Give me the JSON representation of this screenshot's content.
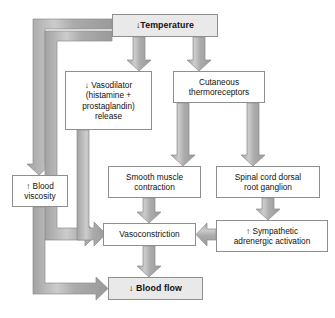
{
  "diagram": {
    "colors": {
      "arrow_fill": "#a6a6a6",
      "arrow_highlight": "#c9c9c9",
      "arrow_stroke": "#8e8e8e",
      "box_border": "#8e8e8e",
      "box_fill": "#ffffff",
      "box_fill_shaded": "#e9e9e9",
      "text": "#111111",
      "page_background": "#ffffff"
    },
    "glyphs": {
      "down_arrow": "↓",
      "up_arrow": "↑"
    },
    "nodes": [
      {
        "id": "temperature",
        "name": "temperature-node",
        "lines": [
          "↓Temperature"
        ],
        "emphasis": "bold",
        "fill": "shaded",
        "x": 112,
        "y": 14,
        "w": 106,
        "h": 23
      },
      {
        "id": "vasodilator",
        "name": "vasodilator-node",
        "lines": [
          "↓ Vasodilator",
          "(histamine +",
          "prostaglandin)",
          "release"
        ],
        "emphasis": "normal",
        "fill": "white",
        "x": 65,
        "y": 71,
        "w": 87,
        "h": 59
      },
      {
        "id": "thermoreceptors",
        "name": "cutaneous-thermoreceptors-node",
        "lines": [
          "Cutaneous",
          "thermoreceptors"
        ],
        "emphasis": "normal",
        "fill": "white",
        "x": 173,
        "y": 71,
        "w": 92,
        "h": 32
      },
      {
        "id": "blood-viscosity",
        "name": "blood-viscosity-node",
        "lines": [
          "↑ Blood",
          "viscosity"
        ],
        "emphasis": "normal",
        "fill": "white",
        "x": 12,
        "y": 175,
        "w": 56,
        "h": 32
      },
      {
        "id": "smooth-muscle",
        "name": "smooth-muscle-contraction-node",
        "lines": [
          "Smooth muscle",
          "contraction"
        ],
        "emphasis": "normal",
        "fill": "white",
        "x": 108,
        "y": 166,
        "w": 93,
        "h": 32
      },
      {
        "id": "spinal-cord",
        "name": "spinal-cord-dorsal-root-ganglion-node",
        "lines": [
          "Spinal cord dorsal",
          "root ganglion"
        ],
        "emphasis": "normal",
        "fill": "white",
        "x": 216,
        "y": 166,
        "w": 104,
        "h": 32
      },
      {
        "id": "sympathetic",
        "name": "sympathetic-adrenergic-activation-node",
        "lines": [
          "↑ Sympathetic",
          "adrenergic activation"
        ],
        "emphasis": "normal",
        "fill": "white",
        "x": 216,
        "y": 220,
        "w": 112,
        "h": 32
      },
      {
        "id": "vasoconstriction",
        "name": "vasoconstriction-node",
        "lines": [
          "Vasoconstriction"
        ],
        "emphasis": "normal",
        "fill": "white",
        "x": 103,
        "y": 223,
        "w": 93,
        "h": 23
      },
      {
        "id": "blood-flow",
        "name": "blood-flow-node",
        "lines": [
          "↓ Blood flow"
        ],
        "emphasis": "bold",
        "fill": "shaded",
        "x": 108,
        "y": 277,
        "w": 95,
        "h": 23
      }
    ],
    "edges": [
      {
        "id": "e1",
        "name": "edge-temperature-to-vasodilator",
        "from": "temperature",
        "to": "vasodilator",
        "shape": "straight-down"
      },
      {
        "id": "e2",
        "name": "edge-temperature-to-thermoreceptors",
        "from": "temperature",
        "to": "thermoreceptors",
        "shape": "straight-down"
      },
      {
        "id": "e3",
        "name": "edge-temperature-to-blood-viscosity",
        "from": "temperature",
        "to": "blood-viscosity",
        "shape": "left-then-down"
      },
      {
        "id": "e4",
        "name": "edge-temperature-to-vasoconstriction",
        "from": "temperature",
        "to": "vasoconstriction",
        "shape": "left-then-down-then-right"
      },
      {
        "id": "e5",
        "name": "edge-vasodilator-to-vasoconstriction",
        "from": "vasodilator",
        "to": "vasoconstriction",
        "shape": "down-then-right"
      },
      {
        "id": "e6",
        "name": "edge-thermoreceptors-to-smooth-muscle",
        "from": "thermoreceptors",
        "to": "smooth-muscle",
        "shape": "straight-down"
      },
      {
        "id": "e7",
        "name": "edge-thermoreceptors-to-spinal-cord",
        "from": "thermoreceptors",
        "to": "spinal-cord",
        "shape": "straight-down"
      },
      {
        "id": "e8",
        "name": "edge-smooth-muscle-to-vasoconstriction",
        "from": "smooth-muscle",
        "to": "vasoconstriction",
        "shape": "straight-down"
      },
      {
        "id": "e9",
        "name": "edge-spinal-cord-to-sympathetic",
        "from": "spinal-cord",
        "to": "sympathetic",
        "shape": "straight-down"
      },
      {
        "id": "e10",
        "name": "edge-sympathetic-to-vasoconstriction",
        "from": "sympathetic",
        "to": "vasoconstriction",
        "shape": "straight-left"
      },
      {
        "id": "e11",
        "name": "edge-vasoconstriction-to-blood-flow",
        "from": "vasoconstriction",
        "to": "blood-flow",
        "shape": "straight-down"
      },
      {
        "id": "e12",
        "name": "edge-blood-viscosity-to-blood-flow",
        "from": "blood-viscosity",
        "to": "blood-flow",
        "shape": "down-then-right"
      }
    ]
  }
}
